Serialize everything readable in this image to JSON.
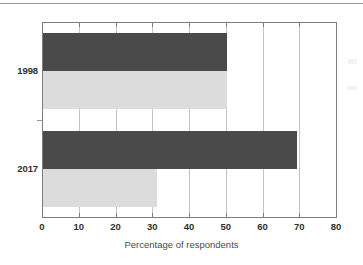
{
  "chart_data": {
    "type": "bar",
    "orientation": "horizontal",
    "title": "",
    "xlabel": "Percentage of respondents",
    "ylabel": "",
    "categories": [
      "1998",
      "2017"
    ],
    "series": [
      {
        "name": "series-1",
        "color": "#4a4a4a",
        "values": [
          50,
          69
        ]
      },
      {
        "name": "series-2",
        "color": "#dcdcdc",
        "values": [
          50,
          31
        ]
      }
    ],
    "xlim": [
      0,
      80
    ],
    "xticks": [
      0,
      10,
      20,
      30,
      40,
      50,
      60,
      70,
      80
    ],
    "xticklabels": [
      "0",
      "10",
      "20",
      "30",
      "40",
      "50",
      "60",
      "70",
      "80"
    ],
    "grid": "vertical",
    "legend": "none"
  },
  "colors": {
    "bar_dark": "#4a4a4a",
    "bar_light": "#dcdcdc",
    "gridline": "#c4c4c4",
    "axis": "#7d7d7d",
    "text": "#2f2f2f",
    "background": "#ffffff"
  }
}
